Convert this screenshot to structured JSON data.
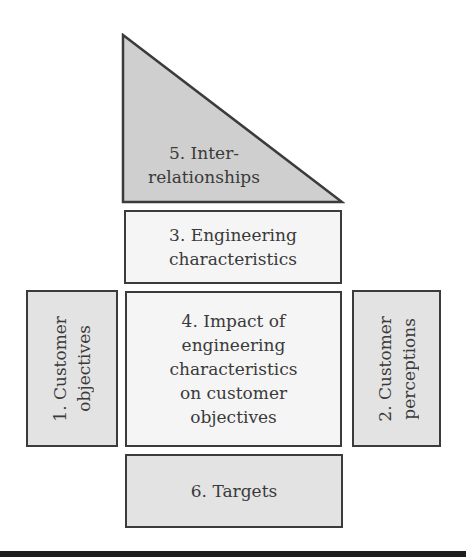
{
  "diagram": {
    "colors": {
      "border": "#3b3b3b",
      "gray_fill": "#e3e3e3",
      "light_fill": "#f5f5f5",
      "triangle_fill": "#cfcfcf",
      "text": "#3a3a3a",
      "bottom_bar": "#1e1e1e"
    },
    "blocks": {
      "interrelationships": {
        "line1": "5. Inter-",
        "line2": "relationships"
      },
      "engineering_characteristics": {
        "line1": "3. Engineering",
        "line2": "characteristics"
      },
      "customer_objectives": {
        "line1": "1. Customer",
        "line2": "objectives"
      },
      "impact": {
        "line1": "4. Impact of",
        "line2": "engineering",
        "line3": "characteristics",
        "line4": "on customer",
        "line5": "objectives"
      },
      "customer_perceptions": {
        "line1": "2. Customer",
        "line2": "perceptions"
      },
      "targets": {
        "line1": "6. Targets"
      }
    }
  }
}
